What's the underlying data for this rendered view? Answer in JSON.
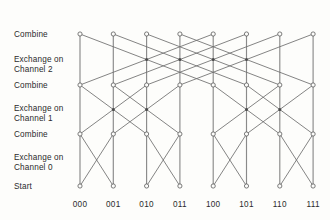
{
  "figure": {
    "background_color": "#fdfdfb",
    "line_color": "#6e6e6e",
    "text_color": "#2b2b2b"
  },
  "stage_labels": [
    {
      "id": "combine-top",
      "text": "Combine",
      "y": 30,
      "row_y": 34
    },
    {
      "id": "exchange-channel-2",
      "text": "Exchange on\nChannel 2",
      "y": 55,
      "row_y": null
    },
    {
      "id": "combine-middle",
      "text": "Combine",
      "y": 81,
      "row_y": 85
    },
    {
      "id": "exchange-channel-1",
      "text": "Exchange on\nChannel 1",
      "y": 104,
      "row_y": null
    },
    {
      "id": "combine-lower",
      "text": "Combine",
      "y": 130,
      "row_y": 134
    },
    {
      "id": "exchange-channel-0",
      "text": "Exchange on\nChannel 0",
      "y": 153,
      "row_y": null
    },
    {
      "id": "start",
      "text": "Start",
      "y": 182,
      "row_y": 186
    }
  ],
  "node_labels": [
    "000",
    "001",
    "010",
    "011",
    "100",
    "101",
    "110",
    "111"
  ],
  "columns_x": [
    80,
    113.3,
    146.6,
    179.9,
    213.2,
    246.5,
    279.8,
    313.1
  ],
  "rows_y": [
    34,
    85,
    134,
    186
  ],
  "node_label_y": 200,
  "chart_data": {
    "type": "diagram",
    "diagram_kind": "butterfly-exchange-combine-network",
    "n_nodes": 8,
    "n_rows": 4,
    "row_names": [
      "Combine (top)",
      "Combine (middle)",
      "Combine (lower)",
      "Start"
    ],
    "stages": [
      {
        "name": "Exchange on Channel 0",
        "from_row": 3,
        "to_row": 2,
        "stride": 1,
        "pairs": [
          [
            0,
            1
          ],
          [
            2,
            3
          ],
          [
            4,
            5
          ],
          [
            6,
            7
          ]
        ]
      },
      {
        "name": "Exchange on Channel 1",
        "from_row": 2,
        "to_row": 1,
        "stride": 2,
        "pairs": [
          [
            0,
            2
          ],
          [
            1,
            3
          ],
          [
            4,
            6
          ],
          [
            5,
            7
          ]
        ]
      },
      {
        "name": "Exchange on Channel 2",
        "from_row": 1,
        "to_row": 0,
        "stride": 4,
        "pairs": [
          [
            0,
            4
          ],
          [
            1,
            5
          ],
          [
            2,
            6
          ],
          [
            3,
            7
          ]
        ]
      }
    ]
  }
}
